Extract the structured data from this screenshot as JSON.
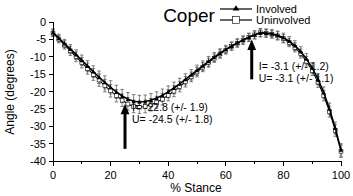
{
  "chart_data": {
    "type": "line",
    "title": "Coper",
    "xlabel": "% Stance",
    "ylabel": "Angle (degrees)",
    "xlim": [
      0,
      100
    ],
    "ylim": [
      -40,
      0
    ],
    "grid": false,
    "legend_position": "top-right",
    "x_ticks": [
      "0",
      "20",
      "40",
      "60",
      "80",
      "100"
    ],
    "x_tick_values": [
      0,
      20,
      40,
      60,
      80,
      100
    ],
    "x_minor_step": 10,
    "y_ticks": [
      "0",
      "-5",
      "-10",
      "-15",
      "-20",
      "-25",
      "-30",
      "-35",
      "-40"
    ],
    "y_tick_values": [
      0,
      -5,
      -10,
      -15,
      -20,
      -25,
      -30,
      -35,
      -40
    ],
    "x": [
      0,
      2,
      4,
      6,
      8,
      10,
      12,
      14,
      16,
      18,
      20,
      22,
      24,
      26,
      28,
      30,
      32,
      34,
      36,
      38,
      40,
      42,
      44,
      46,
      48,
      50,
      52,
      54,
      56,
      58,
      60,
      62,
      64,
      66,
      68,
      70,
      72,
      74,
      76,
      78,
      80,
      82,
      84,
      86,
      88,
      90,
      92,
      94,
      96,
      98,
      100
    ],
    "series": [
      {
        "name": "Involved",
        "marker": "filled-triangle",
        "values": [
          -3.0,
          -4.6,
          -6.2,
          -7.8,
          -9.4,
          -11.0,
          -12.7,
          -14.3,
          -15.9,
          -17.4,
          -18.8,
          -20.1,
          -21.3,
          -22.2,
          -22.8,
          -23.0,
          -22.9,
          -22.5,
          -21.9,
          -21.1,
          -20.1,
          -19.0,
          -17.8,
          -16.5,
          -15.2,
          -13.9,
          -12.6,
          -11.3,
          -10.1,
          -9.0,
          -7.9,
          -6.9,
          -6.0,
          -5.2,
          -4.4,
          -3.7,
          -3.1,
          -3.2,
          -3.4,
          -3.8,
          -4.5,
          -5.5,
          -6.8,
          -8.5,
          -10.6,
          -13.2,
          -16.4,
          -20.3,
          -25.0,
          -30.5,
          -36.8
        ],
        "error": [
          1.0,
          1.1,
          1.2,
          1.3,
          1.4,
          1.5,
          1.6,
          1.7,
          1.8,
          1.9,
          1.9,
          1.9,
          1.9,
          1.9,
          1.9,
          1.9,
          1.9,
          1.9,
          1.8,
          1.8,
          1.7,
          1.7,
          1.6,
          1.6,
          1.5,
          1.5,
          1.4,
          1.4,
          1.3,
          1.3,
          1.2,
          1.2,
          1.2,
          1.2,
          1.2,
          1.2,
          1.2,
          1.2,
          1.2,
          1.2,
          1.3,
          1.3,
          1.4,
          1.4,
          1.5,
          1.5,
          1.6,
          1.6,
          1.7,
          1.7,
          1.8
        ]
      },
      {
        "name": "Uninvolved",
        "marker": "open-square",
        "values": [
          -3.2,
          -4.9,
          -6.6,
          -8.3,
          -10.0,
          -11.7,
          -13.4,
          -15.1,
          -16.7,
          -18.3,
          -19.8,
          -21.2,
          -22.5,
          -23.6,
          -24.3,
          -24.5,
          -24.3,
          -23.8,
          -23.1,
          -22.2,
          -21.1,
          -19.9,
          -18.6,
          -17.2,
          -15.8,
          -14.4,
          -13.0,
          -11.7,
          -10.4,
          -9.2,
          -8.1,
          -7.0,
          -6.1,
          -5.2,
          -4.4,
          -3.7,
          -3.1,
          -3.2,
          -3.5,
          -4.0,
          -4.8,
          -5.9,
          -7.3,
          -9.1,
          -11.3,
          -14.0,
          -17.3,
          -21.2,
          -25.8,
          -31.2,
          -37.2
        ],
        "error": [
          1.0,
          1.1,
          1.2,
          1.3,
          1.4,
          1.5,
          1.6,
          1.7,
          1.8,
          1.8,
          1.8,
          1.8,
          1.8,
          1.8,
          1.8,
          1.8,
          1.8,
          1.8,
          1.7,
          1.7,
          1.6,
          1.6,
          1.5,
          1.5,
          1.4,
          1.4,
          1.3,
          1.3,
          1.2,
          1.2,
          1.1,
          1.1,
          1.1,
          1.1,
          1.1,
          1.1,
          1.1,
          1.1,
          1.1,
          1.2,
          1.2,
          1.2,
          1.3,
          1.3,
          1.4,
          1.4,
          1.5,
          1.5,
          1.6,
          1.7,
          1.8
        ]
      }
    ],
    "annotations": [
      {
        "name": "minimum-annotation",
        "arrow_x": 25,
        "arrow_tip_y": -23.5,
        "arrow_tail_y": -36.5,
        "line1": "I= -22.8 (+/- 1.9)",
        "line2": "U= -24.5 (+/- 1.8)"
      },
      {
        "name": "peak-annotation",
        "arrow_x": 69,
        "arrow_tip_y": -5.0,
        "arrow_tail_y": -16.5,
        "line1": "I= -3.1 (+/- 1.2)",
        "line2": "U= -3.1 (+/- 1.1)"
      }
    ],
    "colors": {
      "line": "#000000",
      "errorbar": "#4d4d4d",
      "background": "#ffffff",
      "text": "#000000"
    }
  },
  "legend": {
    "items": [
      {
        "label": "Involved",
        "marker": "filled-triangle"
      },
      {
        "label": "Uninvolved",
        "marker": "open-square"
      }
    ]
  }
}
